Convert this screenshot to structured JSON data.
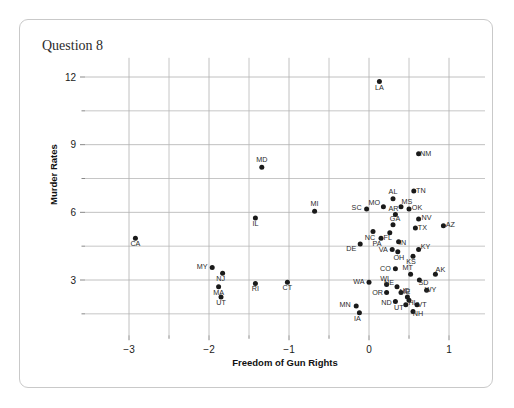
{
  "card": {
    "title": "Question 8"
  },
  "chart_data": {
    "type": "scatter",
    "title": "Question 8",
    "xlabel": "Freedom of Gun Rights",
    "ylabel": "Murder Rates",
    "xlim": [
      -3.55,
      1.45
    ],
    "ylim": [
      0.55,
      12.85
    ],
    "xticks": [
      -3,
      -2,
      -1,
      0,
      1
    ],
    "xtick_labels": [
      "−3",
      "−2",
      "−1",
      "0",
      "1"
    ],
    "yticks": [
      3,
      6,
      9,
      12
    ],
    "ytick_labels": [
      "3",
      "6",
      "9",
      "12"
    ],
    "x_minor_gridlines": [
      -2.5,
      -1.5,
      -0.5,
      0.5
    ],
    "y_minor_gridlines": [
      1.5,
      4.5,
      7.5,
      10.5
    ],
    "grid": true,
    "legend": "none",
    "point_color": "#1a1a1a",
    "points": [
      {
        "label": "LA",
        "x": 0.13,
        "y": 11.8,
        "lx": 0,
        "ly": 8
      },
      {
        "label": "NM",
        "x": 0.62,
        "y": 8.6,
        "lx": 7,
        "ly": 2.5
      },
      {
        "label": "MD",
        "x": -1.34,
        "y": 8.0,
        "lx": 0,
        "ly": -5
      },
      {
        "label": "TN",
        "x": 0.56,
        "y": 6.95,
        "lx": 7,
        "ly": 2
      },
      {
        "label": "AL",
        "x": 0.3,
        "y": 6.6,
        "lx": 0,
        "ly": -5
      },
      {
        "label": "MO",
        "x": 0.18,
        "y": 6.25,
        "lx": -9,
        "ly": -2
      },
      {
        "label": "MS",
        "x": 0.4,
        "y": 6.25,
        "lx": 6,
        "ly": -3
      },
      {
        "label": "OK",
        "x": 0.5,
        "y": 6.15,
        "lx": 8,
        "ly": 1
      },
      {
        "label": "SC",
        "x": -0.03,
        "y": 6.15,
        "lx": -10,
        "ly": 1
      },
      {
        "label": "MI",
        "x": -0.68,
        "y": 6.05,
        "lx": 0,
        "ly": -5
      },
      {
        "label": "AR",
        "x": 0.33,
        "y": 5.9,
        "lx": -2,
        "ly": -4
      },
      {
        "label": "IL",
        "x": -1.42,
        "y": 5.75,
        "lx": 0,
        "ly": 8
      },
      {
        "label": "NV",
        "x": 0.62,
        "y": 5.7,
        "lx": 8,
        "ly": 1
      },
      {
        "label": "GA",
        "x": 0.3,
        "y": 5.45,
        "lx": 2,
        "ly": -4
      },
      {
        "label": "AZ",
        "x": 0.93,
        "y": 5.4,
        "lx": 7,
        "ly": 1
      },
      {
        "label": "TX",
        "x": 0.58,
        "y": 5.3,
        "lx": 7,
        "ly": 2
      },
      {
        "label": "NC",
        "x": 0.05,
        "y": 5.15,
        "lx": -3,
        "ly": 8
      },
      {
        "label": "FL",
        "x": 0.26,
        "y": 5.1,
        "lx": -2,
        "ly": 7
      },
      {
        "label": "PA",
        "x": 0.15,
        "y": 4.85,
        "lx": -4,
        "ly": 8
      },
      {
        "label": "CA",
        "x": -2.92,
        "y": 4.85,
        "lx": 0,
        "ly": 8
      },
      {
        "label": "IN",
        "x": 0.37,
        "y": 4.7,
        "lx": 4,
        "ly": 3
      },
      {
        "label": "DE",
        "x": -0.11,
        "y": 4.6,
        "lx": -9,
        "ly": 7
      },
      {
        "label": "VA",
        "x": 0.29,
        "y": 4.35,
        "lx": -9,
        "ly": 2
      },
      {
        "label": "OH",
        "x": 0.36,
        "y": 4.25,
        "lx": 1,
        "ly": 8
      },
      {
        "label": "KY",
        "x": 0.62,
        "y": 4.35,
        "lx": 7,
        "ly": -1
      },
      {
        "label": "KS",
        "x": 0.55,
        "y": 4.05,
        "lx": -2,
        "ly": 8
      },
      {
        "label": "CO",
        "x": 0.33,
        "y": 3.5,
        "lx": -10,
        "ly": 2
      },
      {
        "label": "MY",
        "x": -1.96,
        "y": 3.55,
        "lx": -10,
        "ly": 1
      },
      {
        "label": "NJ",
        "x": -1.83,
        "y": 3.3,
        "lx": -2,
        "ly": 8
      },
      {
        "label": "MT",
        "x": 0.52,
        "y": 3.25,
        "lx": -3,
        "ly": -4
      },
      {
        "label": "AK",
        "x": 0.83,
        "y": 3.25,
        "lx": 5,
        "ly": -2
      },
      {
        "label": "SD",
        "x": 0.63,
        "y": 3.0,
        "lx": 4,
        "ly": 5
      },
      {
        "label": "WA",
        "x": 0.0,
        "y": 2.9,
        "lx": -10,
        "ly": 2
      },
      {
        "label": "WI",
        "x": 0.22,
        "y": 2.8,
        "lx": -2,
        "ly": -4
      },
      {
        "label": "MA",
        "x": -1.88,
        "y": 2.7,
        "lx": 0,
        "ly": 8
      },
      {
        "label": "RI",
        "x": -1.42,
        "y": 2.85,
        "lx": 0,
        "ly": 8
      },
      {
        "label": "CT",
        "x": -1.02,
        "y": 2.9,
        "lx": 0,
        "ly": 8
      },
      {
        "label": "NE",
        "x": 0.35,
        "y": 2.7,
        "lx": -8,
        "ly": -2
      },
      {
        "label": "WY",
        "x": 0.72,
        "y": 2.55,
        "lx": 4,
        "ly": 2
      },
      {
        "label": "OR",
        "x": 0.22,
        "y": 2.45,
        "lx": -9,
        "ly": 3
      },
      {
        "label": "ME",
        "x": 0.4,
        "y": 2.45,
        "lx": 4,
        "ly": 2
      },
      {
        "label": "UT",
        "x": -1.85,
        "y": 2.25,
        "lx": 0,
        "ly": 8
      },
      {
        "label": "ID",
        "x": 0.48,
        "y": 2.25,
        "lx": -1,
        "ly": -4
      },
      {
        "label": "ND",
        "x": 0.33,
        "y": 2.05,
        "lx": -9,
        "ly": 4
      },
      {
        "label": "UT",
        "x": 0.46,
        "y": 1.9,
        "lx": -7,
        "ly": 5
      },
      {
        "label": "VT",
        "x": 0.6,
        "y": 1.9,
        "lx": 5,
        "ly": 2
      },
      {
        "label": "MN",
        "x": -0.16,
        "y": 1.85,
        "lx": -11,
        "ly": 1
      },
      {
        "label": "NH",
        "x": 0.55,
        "y": 1.6,
        "lx": 5,
        "ly": 4
      },
      {
        "label": "IA",
        "x": -0.12,
        "y": 1.55,
        "lx": -2,
        "ly": 8
      },
      {
        "label": "HI",
        "x": 0.5,
        "y": 2.1,
        "lx": 3,
        "ly": 5
      }
    ]
  }
}
